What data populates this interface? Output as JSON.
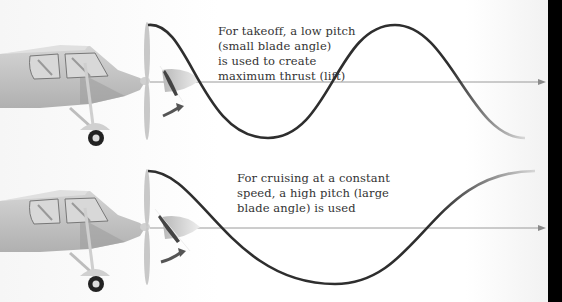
{
  "diagram": {
    "topic": "Propeller blade pitch",
    "panels": [
      {
        "id": "takeoff",
        "caption": "For takeoff, a low pitch\n(small blade angle)\nis used to create\nmaximum thrust (lift)",
        "wave": "short wavelength (low pitch)",
        "blade_angle": "small"
      },
      {
        "id": "cruising",
        "caption": "For cruising at a constant\nspeed, a high pitch (large\nblade angle) is used",
        "wave": "long wavelength (high pitch)",
        "blade_angle": "large"
      }
    ],
    "colors": {
      "wave": "#2e2e2e",
      "axis": "#9a9a9a",
      "plane_body": "#c8c8c8",
      "plane_dark": "#a8a8a8",
      "rotation_arrow": "#555555",
      "background": "#ffffff",
      "edge_band": "#000000"
    }
  }
}
